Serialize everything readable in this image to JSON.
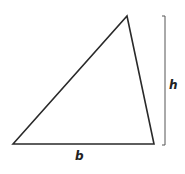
{
  "diagram": {
    "shape": "triangle",
    "vertices": [
      [
        13,
        144
      ],
      [
        127,
        16
      ],
      [
        154,
        144
      ]
    ],
    "stroke_color": "#2a2a2a",
    "height_bracket": {
      "x": 165,
      "y_top": 16,
      "y_bottom": 144,
      "color": "#555555"
    },
    "labels": {
      "base": "b",
      "height": "h"
    }
  }
}
